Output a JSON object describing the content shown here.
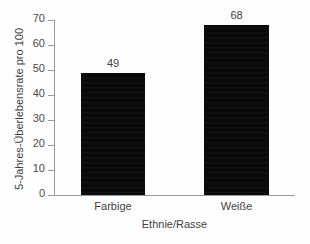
{
  "chart_data": {
    "type": "bar",
    "title": "",
    "subtitle": "",
    "xlabel": "Ethnie/Rasse",
    "ylabel": "5-Jahres-Überlebensrate pro 100",
    "categories": [
      "Farbige",
      "Weiße"
    ],
    "values": [
      49,
      68
    ],
    "data_labels": [
      "49",
      "68"
    ],
    "ylim": [
      0,
      70
    ],
    "yticks": [
      0,
      10,
      20,
      30,
      40,
      50,
      60,
      70
    ],
    "ytick_labels": [
      "0",
      "10",
      "20",
      "30",
      "40",
      "50",
      "60",
      "70"
    ],
    "grid": false,
    "legend": false,
    "legend_position": "none",
    "bar_color": "#0c0c0c",
    "axis_color": "#9a9a9a",
    "text_color": "#3f3f3f",
    "background_color": "#fefefe"
  }
}
